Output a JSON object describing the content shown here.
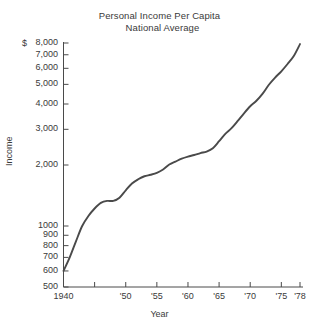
{
  "chart_data": {
    "type": "line",
    "title": "Personal Income Per Capita",
    "subtitle": "National Average",
    "xlabel": "Year",
    "ylabel": "Income",
    "currency_symbol": "$",
    "yscale": "log",
    "ylim": [
      500,
      8000
    ],
    "xlim": [
      1940,
      1978
    ],
    "grid": false,
    "legend": null,
    "ytick_labels": [
      "8,000",
      "7,000",
      "6,000",
      "5,000",
      "4,000",
      "3,000",
      "2,000",
      "1000",
      "900",
      "800",
      "700",
      "600",
      "500"
    ],
    "ytick_values": [
      8000,
      7000,
      6000,
      5000,
      4000,
      3000,
      2000,
      1000,
      900,
      800,
      700,
      600,
      500
    ],
    "xtick_labels": [
      "1940",
      "",
      "'50",
      "'55",
      "'60",
      "'65",
      "'70",
      "'75",
      "'78"
    ],
    "xtick_values": [
      1940,
      1945,
      1950,
      1955,
      1960,
      1965,
      1970,
      1975,
      1978
    ],
    "series": [
      {
        "name": "Personal Income Per Capita",
        "color": "#4a4a4a",
        "x": [
          1940,
          1941,
          1942,
          1943,
          1944,
          1945,
          1946,
          1947,
          1948,
          1949,
          1950,
          1951,
          1952,
          1953,
          1954,
          1955,
          1956,
          1957,
          1958,
          1959,
          1960,
          1961,
          1962,
          1963,
          1964,
          1965,
          1966,
          1967,
          1968,
          1969,
          1970,
          1971,
          1972,
          1973,
          1974,
          1975,
          1976,
          1977,
          1978
        ],
        "values": [
          600,
          700,
          840,
          1000,
          1120,
          1220,
          1300,
          1330,
          1330,
          1380,
          1500,
          1620,
          1700,
          1760,
          1790,
          1830,
          1900,
          2010,
          2080,
          2150,
          2200,
          2240,
          2290,
          2330,
          2420,
          2620,
          2850,
          3040,
          3300,
          3600,
          3900,
          4150,
          4500,
          4980,
          5400,
          5800,
          6300,
          6900,
          7900
        ]
      }
    ]
  },
  "axis_geometry": {
    "left": 63.5,
    "right": 300,
    "top": 43,
    "bottom": 287
  }
}
